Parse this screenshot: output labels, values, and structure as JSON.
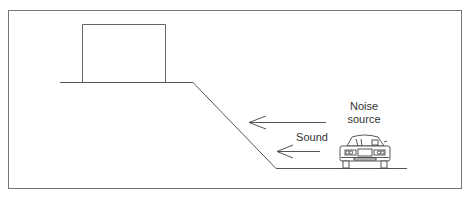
{
  "diagram": {
    "labels": {
      "noise_line1": "Noise",
      "noise_line2": "source",
      "sound": "Sound"
    },
    "colors": {
      "line": "#555555",
      "frame": "#777777",
      "text": "#333333",
      "background": "#ffffff"
    },
    "elements": [
      "frame",
      "building",
      "embankment-ground",
      "road",
      "sound-arrow-upper",
      "sound-arrow-lower",
      "car"
    ]
  }
}
